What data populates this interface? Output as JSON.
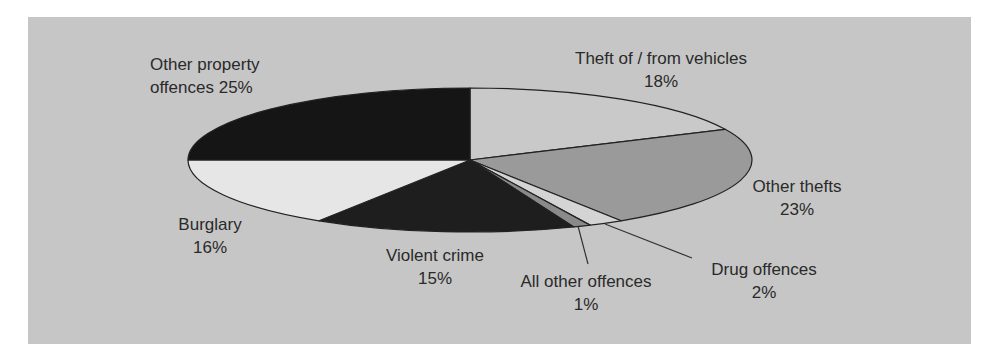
{
  "chart_data": {
    "type": "pie",
    "title": "",
    "style": "3d-flat-ellipse",
    "start_angle": "top (12 o'clock), clockwise",
    "categories": [
      "Theft of / from vehicles",
      "Other thefts",
      "Drug offences",
      "All other offences",
      "Violent crime",
      "Burglary",
      "Other property offences"
    ],
    "values": [
      18,
      23,
      2,
      1,
      15,
      16,
      25
    ],
    "unit": "%",
    "legend": "none (data labels on slices)",
    "colors": [
      "#c9c9c9",
      "#9a9a9a",
      "#d4d4d4",
      "#8a8a8a",
      "#1e1e1e",
      "#e6e6e6",
      "#151515"
    ],
    "slices": [
      {
        "label": "Theft of / from vehicles",
        "pct_text": "18%",
        "value": 18,
        "color": "#c9c9c9"
      },
      {
        "label": "Other thefts",
        "pct_text": "23%",
        "value": 23,
        "color": "#9a9a9a"
      },
      {
        "label": "Drug offences",
        "pct_text": "2%",
        "value": 2,
        "color": "#d4d4d4"
      },
      {
        "label": "All other offences",
        "pct_text": "1%",
        "value": 1,
        "color": "#8a8a8a"
      },
      {
        "label": "Violent crime",
        "pct_text": "15%",
        "value": 15,
        "color": "#1e1e1e"
      },
      {
        "label": "Burglary",
        "pct_text": "16%",
        "value": 16,
        "color": "#e6e6e6"
      },
      {
        "label": "Other property",
        "label_line2": "offences 25%",
        "value": 25,
        "color": "#151515"
      }
    ]
  },
  "panel_color": "#c6c6c6"
}
